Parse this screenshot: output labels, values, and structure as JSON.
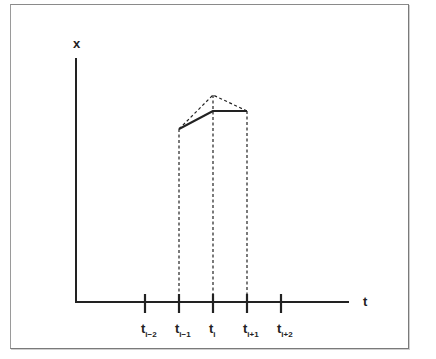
{
  "diagram": {
    "frame": {
      "x": 10,
      "y": 4,
      "width": 397,
      "height": 343
    },
    "axes": {
      "origin": {
        "x": 76,
        "y": 302
      },
      "y_axis_top": 58,
      "x_axis_right": 349,
      "y_label": "x",
      "x_label": "t",
      "y_label_pos": {
        "x": 73,
        "y": 48
      },
      "x_label_pos": {
        "x": 363,
        "y": 306
      },
      "stroke": "#222222"
    },
    "ticks": [
      {
        "x": 145,
        "main": "t",
        "sub": "i−2"
      },
      {
        "x": 179,
        "main": "t",
        "sub": "i−1"
      },
      {
        "x": 213,
        "main": "t",
        "sub": "i"
      },
      {
        "x": 247,
        "main": "t",
        "sub": "i+1"
      },
      {
        "x": 281,
        "main": "t",
        "sub": "i+2"
      }
    ],
    "tick_extent": {
      "top": 294,
      "bottom": 313
    },
    "tick_label_y": 333,
    "solid_polyline": [
      {
        "x": 179,
        "y": 129
      },
      {
        "x": 213,
        "y": 111
      },
      {
        "x": 247,
        "y": 111
      }
    ],
    "dotted_polyline": [
      {
        "x": 179,
        "y": 129
      },
      {
        "x": 213,
        "y": 95
      },
      {
        "x": 247,
        "y": 111
      }
    ],
    "dotted_verticals": [
      {
        "x": 179,
        "y_top": 129
      },
      {
        "x": 213,
        "y_top": 95
      },
      {
        "x": 247,
        "y_top": 111
      }
    ],
    "colors": {
      "line": "#222222",
      "frame": "#8a8a8a",
      "background": "#ffffff"
    }
  }
}
